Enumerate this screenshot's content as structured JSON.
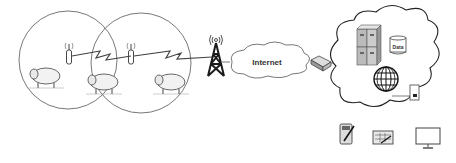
{
  "diagram": {
    "type": "iot-livestock-monitoring-network",
    "colors": {
      "stroke": "#444444",
      "line": "#555555",
      "fill_light": "#f4f4f4",
      "tower": "#1a1a1a"
    },
    "nodes": [
      {
        "id": "zone1",
        "shape": "circle",
        "contains": [
          "sheep",
          "relay-antenna"
        ]
      },
      {
        "id": "zone2",
        "shape": "circle",
        "contains": [
          "sheep",
          "sheep",
          "relay-antenna"
        ]
      },
      {
        "id": "sheep-outside",
        "shape": "sheep"
      },
      {
        "id": "cell-tower",
        "shape": "tower"
      },
      {
        "id": "internet-cloud",
        "shape": "cloud",
        "label": "Internet"
      },
      {
        "id": "gateway",
        "shape": "router"
      },
      {
        "id": "server-cloud",
        "shape": "cloud",
        "contains": [
          "server-rack",
          "database",
          "globe",
          "document"
        ]
      },
      {
        "id": "devices",
        "items": [
          "tablet",
          "spreadsheet-tablet",
          "monitor"
        ]
      }
    ],
    "edges": [
      {
        "from": "antenna1",
        "to": "antenna2",
        "style": "wireless-bolt"
      },
      {
        "from": "antenna2",
        "to": "cell-tower",
        "style": "wireless-bolt"
      },
      {
        "from": "cell-tower",
        "to": "internet-cloud",
        "style": "line"
      },
      {
        "from": "internet-cloud",
        "to": "gateway",
        "style": "line"
      },
      {
        "from": "gateway",
        "to": "server-cloud",
        "style": "line"
      }
    ]
  },
  "labels": {
    "internet": "Internet",
    "data": "Data"
  }
}
